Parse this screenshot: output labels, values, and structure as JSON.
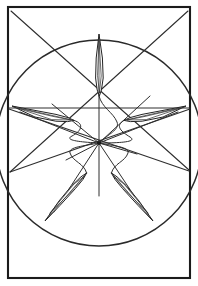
{
  "figure": {
    "caption": "",
    "background_color": "#ffffff",
    "ink_color": "#232323",
    "frame_stroke_color": "#1b1b1b",
    "circle_stroke_color": "#2a2a2a",
    "line_stroke_color": "#2e2e2e"
  },
  "canvas": {
    "width": 198,
    "height": 286
  },
  "frame": {
    "label": "outer-rectangle",
    "x": 8,
    "y": 7,
    "width": 182,
    "height": 271,
    "stroke_width": 2.1
  },
  "circle": {
    "label": "enclosing-circle",
    "cx": 99,
    "cy": 143,
    "r": 103,
    "stroke_width": 1.5
  },
  "hub": {
    "label": "center-hub",
    "cx": 99,
    "cy": 143,
    "r": 2.1
  },
  "chords": [
    {
      "name": "chord-top-left-to-lower-right",
      "x1": 11,
      "y1": 11,
      "x2": 189,
      "y2": 170
    },
    {
      "name": "chord-top-right-to-lower-left",
      "x1": 188,
      "y1": 11,
      "x2": 10,
      "y2": 172
    },
    {
      "name": "chord-left-edge-to-right-edge",
      "x1": 9,
      "y1": 108,
      "x2": 190,
      "y2": 108
    },
    {
      "name": "chord-left-upper-to-right-lower",
      "x1": 9,
      "y1": 109,
      "x2": 189,
      "y2": 171
    },
    {
      "name": "chord-right-upper-to-left-lower",
      "x1": 190,
      "y1": 109,
      "x2": 10,
      "y2": 172
    }
  ],
  "spokes": [
    {
      "name": "spoke-north",
      "angle_deg": 270,
      "tip_x": 99,
      "tip_y": 38
    },
    {
      "name": "spoke-west",
      "angle_deg": 198,
      "tip_x": 14,
      "tip_y": 110
    },
    {
      "name": "spoke-east",
      "angle_deg": 342,
      "tip_x": 184,
      "tip_y": 110
    },
    {
      "name": "spoke-southwest",
      "angle_deg": 126,
      "tip_x": 47,
      "tip_y": 217
    },
    {
      "name": "spoke-southeast",
      "angle_deg": 54,
      "tip_x": 152,
      "tip_y": 217
    }
  ],
  "blades": [
    {
      "name": "blade-north",
      "outline": "M 99 34 L 102.4 58 L 103.2 78 L 101.4 90 L 99.4 96 L 97.2 90 L 95.6 78 L 96.2 58 Z",
      "spine": "M 99 35 L 99 96",
      "inner": "M 99 40 L 101.2 76 L 99.4 93 L 97.6 76 Z"
    },
    {
      "name": "blade-west",
      "outline": "M 12 106 L 36 110.6 L 56 114.4 L 68 117.6 L 74 120.4 L 67.6 121.6 L 55.8 121.2 L 35 117 Z",
      "spine": "M 13 106.6 L 74 120.4",
      "inner": "M 18 108.2 L 53 116.4 L 71 120 L 52 119.6 Z"
    },
    {
      "name": "blade-east",
      "outline": "M 186 106 L 162 110.6 L 142 114.4 L 130 117.6 L 124 120.4 L 130.4 121.6 L 142.2 121.2 L 163 117 Z",
      "spine": "M 185 106.6 L 124 120.4",
      "inner": "M 180 108.2 L 145 116.4 L 127 120 L 146 119.6 Z"
    },
    {
      "name": "blade-southwest",
      "outline": "M 45 221 L 59 201 L 71.8 185.6 L 81 176.8 L 86.6 173 L 83 179.4 L 75.4 188.6 L 60 205.4 Z",
      "spine": "M 45.8 220 L 86.6 173",
      "inner": "M 50 213 L 74 184 L 84.6 176 L 70 193 Z"
    },
    {
      "name": "blade-southeast",
      "outline": "M 153 221 L 139 201 L 126.2 185.6 L 117 176.8 L 111.4 173 L 115 179.4 L 122.6 188.6 L 138 205.4 Z",
      "spine": "M 152.2 220 L 111.4 173",
      "inner": "M 148 213 L 124 184 L 113.4 176 L 128 193 Z"
    }
  ],
  "shafts": [
    {
      "name": "shaft-north-curve",
      "d": "M 99 96 C 102 108 113 112 117 122 C 120 130 108 134 99 143"
    },
    {
      "name": "shaft-west-curve",
      "d": "M 74 120.4 C 86 124 80 132 72 136 C 64 140 78 142 99 143"
    },
    {
      "name": "shaft-east-curve",
      "d": "M 124 120.4 C 114 126 122 132 130 137 C 138 142 120 143 99 143"
    },
    {
      "name": "shaft-southwest-curve",
      "d": "M 86.6 173 C 84 163 73 162 70 153 C 68 147 84 146 99 143"
    },
    {
      "name": "shaft-southeast-curve",
      "d": "M 111.4 173 C 114 163 125 162 128 153 C 130 147 114 146 99 143"
    },
    {
      "name": "shaft-north-long-straight",
      "d": "M 99 38 L 99 196"
    },
    {
      "name": "shaft-southwest-straight",
      "d": "M 99 143 L 54 212"
    },
    {
      "name": "shaft-southeast-straight",
      "d": "M 99 143 L 145 212"
    },
    {
      "name": "shaft-west-straight",
      "d": "M 99 143 L 20 112"
    },
    {
      "name": "shaft-east-straight",
      "d": "M 99 143 L 178 112"
    },
    {
      "name": "shaft-upper-right-brace",
      "d": "M 99 143 L 150 96"
    },
    {
      "name": "shaft-upper-left-brace",
      "d": "M 99 143 L 52 104"
    },
    {
      "name": "shaft-lower-flat-right",
      "d": "M 99 143 L 137 154"
    },
    {
      "name": "shaft-lower-flat-left",
      "d": "M 99 143 L 66 160"
    }
  ]
}
